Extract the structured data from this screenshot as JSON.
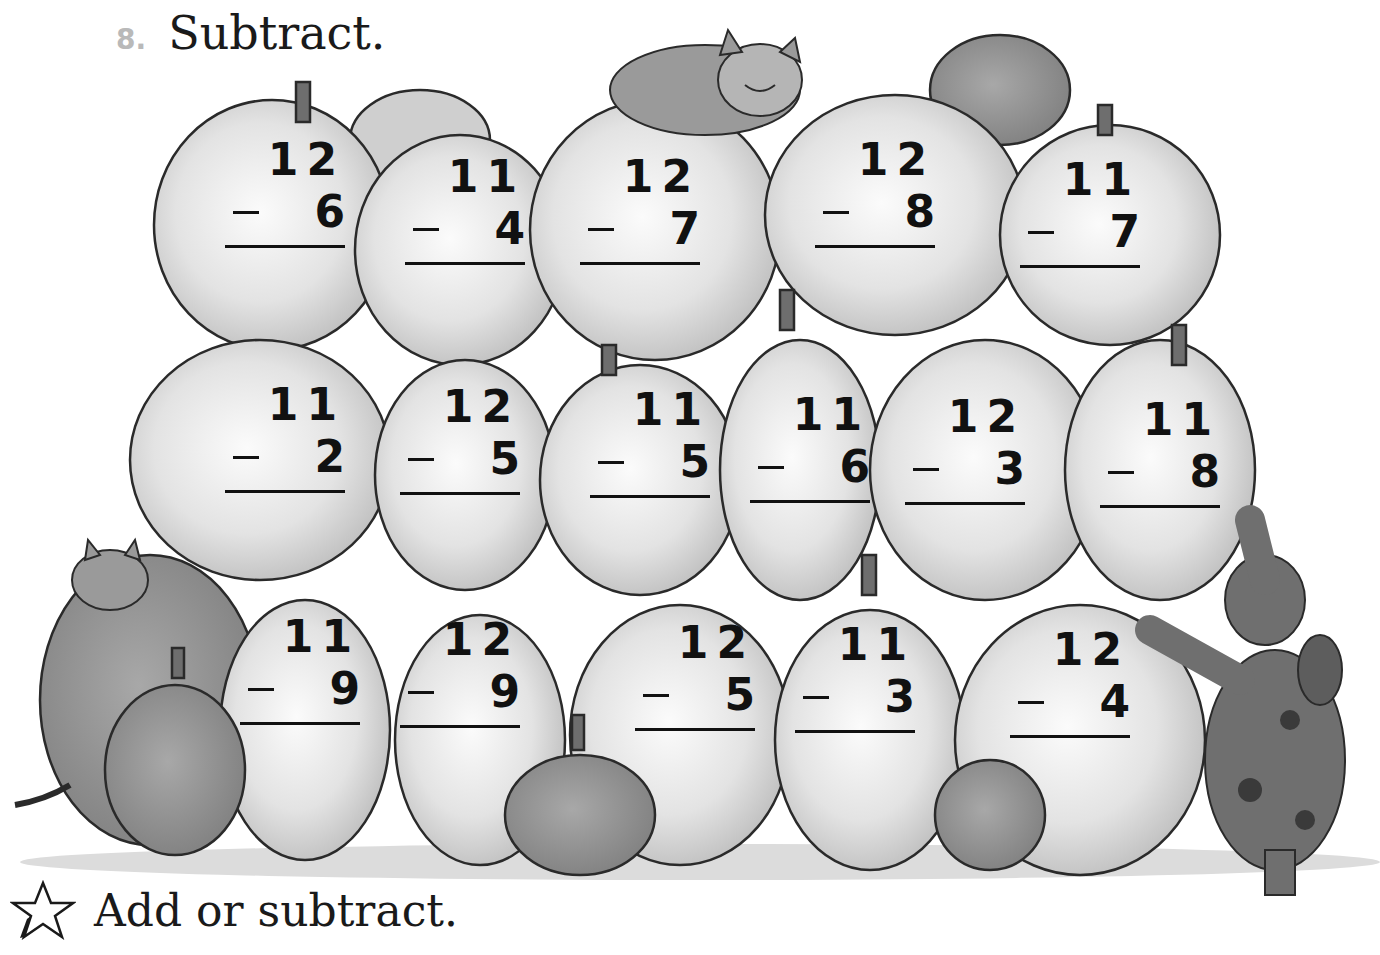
{
  "header": {
    "exercise_number": "8.",
    "instruction": "Subtract."
  },
  "problems": [
    {
      "row": 1,
      "minuend": "12",
      "subtrahend": "6"
    },
    {
      "row": 1,
      "minuend": "11",
      "subtrahend": "4"
    },
    {
      "row": 1,
      "minuend": "12",
      "subtrahend": "7"
    },
    {
      "row": 1,
      "minuend": "12",
      "subtrahend": "8"
    },
    {
      "row": 1,
      "minuend": "11",
      "subtrahend": "7"
    },
    {
      "row": 2,
      "minuend": "11",
      "subtrahend": "2"
    },
    {
      "row": 2,
      "minuend": "12",
      "subtrahend": "5"
    },
    {
      "row": 2,
      "minuend": "11",
      "subtrahend": "5"
    },
    {
      "row": 2,
      "minuend": "11",
      "subtrahend": "6"
    },
    {
      "row": 2,
      "minuend": "12",
      "subtrahend": "3"
    },
    {
      "row": 2,
      "minuend": "11",
      "subtrahend": "8"
    },
    {
      "row": 3,
      "minuend": "11",
      "subtrahend": "9"
    },
    {
      "row": 3,
      "minuend": "12",
      "subtrahend": "9"
    },
    {
      "row": 3,
      "minuend": "12",
      "subtrahend": "5"
    },
    {
      "row": 3,
      "minuend": "11",
      "subtrahend": "3"
    },
    {
      "row": 3,
      "minuend": "12",
      "subtrahend": "4"
    }
  ],
  "illustration": {
    "description": "Grayscale pile of pumpkins with a cat on top, a kitten peeking at lower left, and a spotted dog standing at right",
    "characters": [
      "cat-top",
      "kitten-left",
      "dog-right"
    ]
  },
  "footer": {
    "icon": "star-outline-icon",
    "instruction": "Add or subtract."
  },
  "colors": {
    "ink": "#111111",
    "exercise_number": "#b9b9b9",
    "pumpkin_light": "#e6e6e6",
    "pumpkin_mid": "#bdbdbd",
    "pumpkin_dark": "#8a8a8a",
    "outline": "#2a2a2a"
  }
}
